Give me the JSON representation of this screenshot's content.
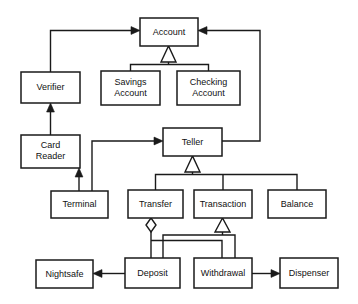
{
  "diagram": {
    "type": "uml-class-diagram",
    "background_color": "#ffffff",
    "line_color": "#1a1a1a",
    "box_fill": "#ffffff",
    "classes": [
      {
        "id": "account",
        "label": "Account",
        "label_line1": "Account",
        "label_line2": "",
        "x": 140,
        "y": 18,
        "w": 58,
        "h": 28
      },
      {
        "id": "verifier",
        "label": "Verifier",
        "label_line1": "Verifier",
        "label_line2": "",
        "x": 21,
        "y": 72,
        "w": 59,
        "h": 31
      },
      {
        "id": "savings",
        "label": "Savings Account",
        "label_line1": "Savings",
        "label_line2": "Account",
        "x": 101,
        "y": 71,
        "w": 59,
        "h": 34
      },
      {
        "id": "checking",
        "label": "Checking Account",
        "label_line1": "Checking",
        "label_line2": "Account",
        "x": 177,
        "y": 71,
        "w": 63,
        "h": 34
      },
      {
        "id": "cardreader",
        "label": "Card Reader",
        "label_line1": "Card",
        "label_line2": "Reader",
        "x": 21,
        "y": 135,
        "w": 59,
        "h": 33
      },
      {
        "id": "teller",
        "label": "Teller",
        "label_line1": "Teller",
        "label_line2": "",
        "x": 163,
        "y": 128,
        "w": 59,
        "h": 28
      },
      {
        "id": "terminal",
        "label": "Terminal",
        "label_line1": "Terminal",
        "label_line2": "",
        "x": 51,
        "y": 191,
        "w": 57,
        "h": 27
      },
      {
        "id": "transfer",
        "label": "Transfer",
        "label_line1": "Transfer",
        "label_line2": "",
        "x": 128,
        "y": 190,
        "w": 55,
        "h": 28
      },
      {
        "id": "transaction",
        "label": "Transaction",
        "label_line1": "Transaction",
        "label_line2": "",
        "x": 194,
        "y": 190,
        "w": 58,
        "h": 28
      },
      {
        "id": "balance",
        "label": "Balance",
        "label_line1": "Balance",
        "label_line2": "",
        "x": 268,
        "y": 190,
        "w": 58,
        "h": 28
      },
      {
        "id": "nightsafe",
        "label": "Nightsafe",
        "label_line1": "Nightsafe",
        "label_line2": "",
        "x": 36,
        "y": 260,
        "w": 57,
        "h": 28
      },
      {
        "id": "deposit",
        "label": "Deposit",
        "label_line1": "Deposit",
        "label_line2": "",
        "x": 125,
        "y": 258,
        "w": 55,
        "h": 30
      },
      {
        "id": "withdrawal",
        "label": "Withdrawal",
        "label_line1": "Withdrawal",
        "label_line2": "",
        "x": 194,
        "y": 258,
        "w": 58,
        "h": 30
      },
      {
        "id": "dispenser",
        "label": "Dispenser",
        "label_line1": "Dispenser",
        "label_line2": "",
        "x": 280,
        "y": 258,
        "w": 58,
        "h": 30
      }
    ],
    "relationships": [
      {
        "id": "verifier-account",
        "from": "Verifier",
        "to": "Account",
        "kind": "association-arrow"
      },
      {
        "id": "teller-account",
        "from": "Teller",
        "to": "Account",
        "kind": "association-arrow"
      },
      {
        "id": "account-savings",
        "from": "Account",
        "to": "Savings Account",
        "kind": "generalization"
      },
      {
        "id": "account-checking",
        "from": "Account",
        "to": "Checking Account",
        "kind": "generalization"
      },
      {
        "id": "cardreader-verifier",
        "from": "Card Reader",
        "to": "Verifier",
        "kind": "association-arrow"
      },
      {
        "id": "terminal-cardreader",
        "from": "Terminal",
        "to": "Card Reader",
        "kind": "association-arrow"
      },
      {
        "id": "terminal-teller",
        "from": "Terminal",
        "to": "Teller",
        "kind": "association-arrow"
      },
      {
        "id": "teller-transfer",
        "from": "Teller",
        "to": "Transfer",
        "kind": "generalization"
      },
      {
        "id": "teller-transaction",
        "from": "Teller",
        "to": "Transaction",
        "kind": "generalization"
      },
      {
        "id": "teller-balance",
        "from": "Teller",
        "to": "Balance",
        "kind": "generalization"
      },
      {
        "id": "transfer-deposit",
        "from": "Transfer",
        "to": "Deposit",
        "kind": "aggregation"
      },
      {
        "id": "transfer-withdrawal",
        "from": "Transfer",
        "to": "Withdrawal",
        "kind": "aggregation"
      },
      {
        "id": "transaction-deposit",
        "from": "Transaction",
        "to": "Deposit",
        "kind": "generalization"
      },
      {
        "id": "transaction-withdrawal",
        "from": "Transaction",
        "to": "Withdrawal",
        "kind": "generalization"
      },
      {
        "id": "deposit-nightsafe",
        "from": "Deposit",
        "to": "Nightsafe",
        "kind": "association-arrow"
      },
      {
        "id": "withdrawal-dispenser",
        "from": "Withdrawal",
        "to": "Dispenser",
        "kind": "association-arrow"
      }
    ]
  }
}
